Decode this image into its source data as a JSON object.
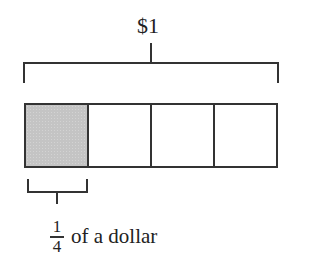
{
  "diagram": {
    "total_label": "$1",
    "bar": {
      "segments": 4,
      "shaded_segments": 1,
      "shade_color": "#c4c4c4",
      "stroke_color": "#333333"
    },
    "part_label": {
      "fraction": {
        "numerator": "1",
        "denominator": "4"
      },
      "text": "of a dollar"
    }
  }
}
